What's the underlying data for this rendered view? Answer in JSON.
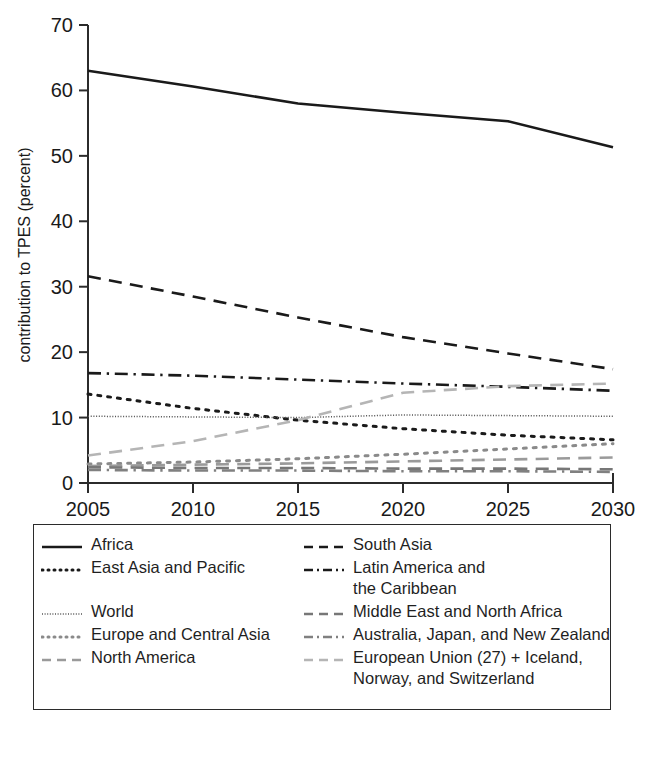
{
  "chart_data": {
    "type": "line",
    "title": "",
    "xlabel": "",
    "ylabel": "contribution to TPES (percent)",
    "xlim": [
      2005,
      2030
    ],
    "ylim": [
      0,
      70
    ],
    "grid": false,
    "legend_position": "bottom",
    "x": [
      2005,
      2010,
      2015,
      2020,
      2025,
      2030
    ],
    "xticks": [
      "2005",
      "2010",
      "2015",
      "2020",
      "2025",
      "2030"
    ],
    "yticks": [
      "0",
      "10",
      "20",
      "30",
      "40",
      "50",
      "60",
      "70"
    ],
    "series": [
      {
        "name": "Africa",
        "style": "solid",
        "color": "#1a1a1a",
        "values": [
          63.0,
          60.6,
          58.0,
          56.6,
          55.3,
          51.3
        ]
      },
      {
        "name": "South Asia",
        "style": "dashed",
        "color": "#1a1a1a",
        "values": [
          31.6,
          28.5,
          25.3,
          22.3,
          19.8,
          17.4
        ]
      },
      {
        "name": "Latin America and\nthe Caribbean",
        "style": "dash-dot",
        "color": "#1a1a1a",
        "values": [
          16.8,
          16.4,
          15.8,
          15.2,
          14.7,
          14.1
        ]
      },
      {
        "name": "East Asia and Pacific",
        "style": "dotted",
        "color": "#1a1a1a",
        "values": [
          13.6,
          11.4,
          9.6,
          8.3,
          7.3,
          6.6
        ]
      },
      {
        "name": "World",
        "style": "fine-dotted",
        "color": "#555555",
        "values": [
          10.2,
          10.1,
          10.0,
          10.4,
          10.3,
          10.2
        ]
      },
      {
        "name": "European Union (27) + Iceland,\nNorway, and Switzerland",
        "style": "dashed",
        "color": "#b5b5b5",
        "values": [
          4.2,
          6.4,
          9.6,
          13.8,
          14.8,
          15.2
        ]
      },
      {
        "name": "Europe and Central Asia",
        "style": "dotted",
        "color": "#8a8a8a",
        "values": [
          2.9,
          3.2,
          3.7,
          4.4,
          5.2,
          6.0
        ]
      },
      {
        "name": "North America",
        "style": "dashed",
        "color": "#9a9a9a",
        "values": [
          2.6,
          2.8,
          3.0,
          3.3,
          3.6,
          3.9
        ]
      },
      {
        "name": "Middle East and North Africa",
        "style": "dashed",
        "color": "#777777",
        "values": [
          2.4,
          2.3,
          2.3,
          2.2,
          2.2,
          2.1
        ]
      },
      {
        "name": "Australia, Japan, and New Zealand",
        "style": "dash-dot",
        "color": "#808080",
        "values": [
          2.0,
          1.9,
          1.9,
          1.8,
          1.8,
          1.7
        ]
      }
    ]
  },
  "axis": {
    "y_title": "contribution to TPES (percent)",
    "y_ticks": [
      "70",
      "60",
      "50",
      "40",
      "30",
      "20",
      "10",
      "0"
    ],
    "x_ticks": [
      "2005",
      "2010",
      "2015",
      "2020",
      "2025",
      "2030"
    ]
  },
  "legend": {
    "left_column": [
      {
        "label": "Africa",
        "style": "solid",
        "color": "#1a1a1a"
      },
      {
        "label": "East Asia and Pacific",
        "style": "dotted",
        "color": "#1a1a1a"
      },
      {
        "label": "World",
        "style": "fine-dotted",
        "color": "#555555"
      },
      {
        "label": "Europe and Central Asia",
        "style": "dotted",
        "color": "#8a8a8a"
      },
      {
        "label": "North America",
        "style": "dashed",
        "color": "#9a9a9a"
      }
    ],
    "right_column": [
      {
        "label": "South Asia",
        "style": "dashed",
        "color": "#1a1a1a"
      },
      {
        "label": "Latin America and\nthe Caribbean",
        "style": "dash-dot",
        "color": "#1a1a1a"
      },
      {
        "label": "Middle East and North Africa",
        "style": "dashed",
        "color": "#777777"
      },
      {
        "label": "Australia, Japan, and New Zealand",
        "style": "dash-dot",
        "color": "#808080"
      },
      {
        "label": "European Union (27) + Iceland,\nNorway, and Switzerland",
        "style": "dashed",
        "color": "#b5b5b5"
      }
    ]
  }
}
